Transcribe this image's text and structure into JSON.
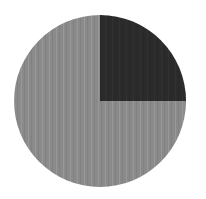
{
  "figure": {
    "background_color": "#ffffff",
    "width": 206,
    "height": 199
  },
  "chart_data": {
    "type": "pie",
    "title": "",
    "subtitle": "",
    "xlabel": "",
    "ylabel": "",
    "labels": [
      "Remainder",
      "Highlighted quarter"
    ],
    "values": [
      75,
      25
    ],
    "value_unit": "percent",
    "colors": [
      "#8a8a8a",
      "#2b2b2b"
    ],
    "start_angle_deg": 90,
    "direction": "clockwise",
    "legend": false,
    "legend_position": "none",
    "grid": false,
    "data_labels": false,
    "annotations": [],
    "slices": [
      {
        "label": "Highlighted quarter",
        "value": 25,
        "color": "#2b2b2b",
        "start_angle_deg": 0,
        "end_angle_deg": 90,
        "quadrant": "upper-right"
      },
      {
        "label": "Remainder",
        "value": 75,
        "color": "#8a8a8a",
        "start_angle_deg": 90,
        "end_angle_deg": 360,
        "quadrant": "upper-left, lower-left, lower-right"
      }
    ],
    "geometry": {
      "center_x": 100,
      "center_y": 101,
      "radius": 86
    }
  }
}
